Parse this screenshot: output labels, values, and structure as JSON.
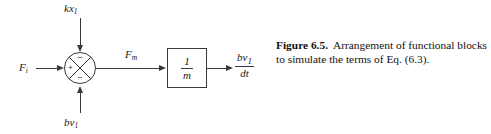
{
  "figure": {
    "diagram": {
      "type": "block-diagram",
      "summing_junction": {
        "name": "summing-junction",
        "shape": "circle-with-x",
        "signs": {
          "top": "−",
          "left": "+",
          "bottom": "−"
        }
      },
      "blocks": [
        {
          "name": "gain-block-one-over-m",
          "numerator": "1",
          "denominator": "m"
        }
      ],
      "inputs": [
        {
          "name": "input-kx1",
          "label_main": "kx",
          "label_sub": "1",
          "direction": "down",
          "sign": "−"
        },
        {
          "name": "input-Fi",
          "label_main": "F",
          "label_sub": "i",
          "direction": "right",
          "sign": "+"
        },
        {
          "name": "input-bv1",
          "label_main": "bv",
          "label_sub": "1",
          "direction": "up",
          "sign": "−"
        }
      ],
      "signals": [
        {
          "name": "signal-Fm",
          "label_main": "F",
          "label_sub": "m"
        }
      ],
      "output": {
        "name": "output-dv1-dt",
        "numerator_main": "bv",
        "numerator_sub": "1",
        "denominator": "dt"
      },
      "stroke_color": "#3a3a3a"
    },
    "caption": {
      "label": "Figure 6.5.",
      "text": "Arrangement of functional blocks to simulate the terms of Eq. (6.3)."
    }
  }
}
